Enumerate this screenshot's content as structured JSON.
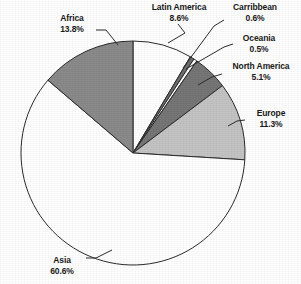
{
  "chart_data": {
    "type": "pie",
    "title": "",
    "subtitle": "",
    "xlabel": "",
    "ylabel": "",
    "legend_position": "none",
    "grid": false,
    "value_unit": "percent",
    "start_angle_deg": 0,
    "direction": "clockwise",
    "categories": [
      "Latin America",
      "Carribbean",
      "Oceania",
      "North America",
      "Europe",
      "Asia",
      "Africa"
    ],
    "values": [
      8.6,
      0.6,
      0.5,
      5.1,
      11.3,
      60.6,
      13.8
    ],
    "slices": [
      {
        "label": "Latin America",
        "value": 8.6,
        "value_text": "8.6%",
        "fill": "#ffffff",
        "stroke": "#2b2b2b"
      },
      {
        "label": "Carribbean",
        "value": 0.6,
        "value_text": "0.6%",
        "fill": "#6e6e6e",
        "stroke": "#2b2b2b"
      },
      {
        "label": "Oceania",
        "value": 0.5,
        "value_text": "0.5%",
        "fill": "#ffffff",
        "stroke": "#2b2b2b"
      },
      {
        "label": "North America",
        "value": 5.1,
        "value_text": "5.1%",
        "fill": "#767676",
        "stroke": "#2b2b2b"
      },
      {
        "label": "Europe",
        "value": 11.3,
        "value_text": "11.3%",
        "fill": "#c4c4c4",
        "stroke": "#2b2b2b"
      },
      {
        "label": "Asia",
        "value": 60.6,
        "value_text": "60.6%",
        "fill": "#ffffff",
        "stroke": "#2b2b2b"
      },
      {
        "label": "Africa",
        "value": 13.8,
        "value_text": "13.8%",
        "fill": "#8a8a8a",
        "stroke": "#2b2b2b"
      }
    ]
  },
  "labels": {
    "africa": {
      "name": "Africa",
      "value": "13.8%"
    },
    "latin_america": {
      "name": "Latin America",
      "value": "8.6%"
    },
    "carribbean": {
      "name": "Carribbean",
      "value": "0.6%"
    },
    "oceania": {
      "name": "Oceania",
      "value": "0.5%"
    },
    "north_america": {
      "name": "North America",
      "value": "5.1%"
    },
    "europe": {
      "name": "Europe",
      "value": "11.3%"
    },
    "asia": {
      "name": "Asia",
      "value": "60.6%"
    }
  },
  "colors": {
    "outline": "#2b2b2b",
    "text": "#1a1a1a",
    "background": "#ffffff",
    "slice_dark": "#767676",
    "slice_mid": "#8a8a8a",
    "slice_light": "#c4c4c4",
    "slice_white": "#ffffff"
  }
}
